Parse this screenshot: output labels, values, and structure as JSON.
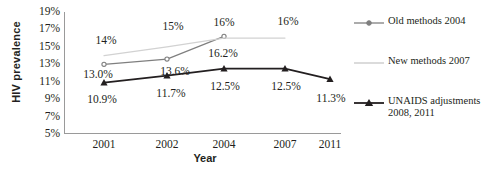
{
  "chart_data": {
    "type": "line",
    "title": "",
    "xlabel": "Year",
    "ylabel": "HIV prevalence",
    "categories": [
      "2001",
      "2002",
      "2004",
      "2007",
      "2011"
    ],
    "ylim": [
      5,
      19
    ],
    "ytick_labels": [
      "19%",
      "17%",
      "15%",
      "13%",
      "11%",
      "9%",
      "7%",
      "5%"
    ],
    "ytick_values": [
      19,
      17,
      15,
      13,
      11,
      9,
      7,
      5
    ],
    "grid": false,
    "legend_position": "right",
    "series": [
      {
        "name": "Old methods 2004",
        "color": "#7f7f7f",
        "marker": "circle",
        "x": [
          "2001",
          "2002",
          "2004"
        ],
        "values": [
          13.0,
          13.6,
          16.2
        ],
        "point_labels": [
          "13.0%",
          "13.6%",
          "16.2%"
        ]
      },
      {
        "name": "New methods 2007",
        "color": "#d2d2d2",
        "marker": "none",
        "x": [
          "2001",
          "2002",
          "2004",
          "2007"
        ],
        "values": [
          14.0,
          15.0,
          16.0,
          16.0
        ],
        "point_labels": [
          "14%",
          "15%",
          "16%",
          "16%"
        ]
      },
      {
        "name": "UNAIDS adjustments 2008, 2011",
        "color": "#231f20",
        "marker": "triangle",
        "x": [
          "2001",
          "2002",
          "2004",
          "2007",
          "2011"
        ],
        "values": [
          10.9,
          11.7,
          12.5,
          12.5,
          11.3
        ],
        "point_labels": [
          "10.9%",
          "11.7%",
          "12.5%",
          "12.5%",
          "11.3%"
        ]
      }
    ],
    "annotations": [
      {
        "text": "14%",
        "series": "New methods 2007",
        "category": "2001"
      },
      {
        "text": "15%",
        "series": "New methods 2007",
        "category": "2002"
      },
      {
        "text": "16%",
        "series": "New methods 2007",
        "category": "2004"
      },
      {
        "text": "16%",
        "series": "New methods 2007",
        "category": "2007"
      },
      {
        "text": "13.0%",
        "series": "Old methods 2004",
        "category": "2001"
      },
      {
        "text": "13.6%",
        "series": "Old methods 2004",
        "category": "2002"
      },
      {
        "text": "16.2%",
        "series": "Old methods 2004",
        "category": "2004"
      },
      {
        "text": "10.9%",
        "series": "UNAIDS adjustments",
        "category": "2001"
      },
      {
        "text": "11.7%",
        "series": "UNAIDS adjustments",
        "category": "2002"
      },
      {
        "text": "12.5%",
        "series": "UNAIDS adjustments",
        "category": "2004"
      },
      {
        "text": "12.5%",
        "series": "UNAIDS adjustments",
        "category": "2007"
      },
      {
        "text": "11.3%",
        "series": "UNAIDS adjustments",
        "category": "2011"
      }
    ]
  },
  "legend": {
    "items": [
      {
        "label": "Old methods 2004",
        "sub": "",
        "marker": "circle-marker-icon",
        "color": "#7f7f7f"
      },
      {
        "label": "New methods 2007",
        "sub": "",
        "marker": "line-swatch-icon",
        "color": "#d2d2d2"
      },
      {
        "label": "UNAIDS adjustments",
        "sub": "2008, 2011",
        "marker": "triangle-marker-icon",
        "color": "#231f20"
      }
    ]
  },
  "axes": {
    "y_title": "HIV prevalence",
    "x_title": "Year",
    "y_ticks": [
      "19%",
      "17%",
      "15%",
      "13%",
      "11%",
      "9%",
      "7%",
      "5%"
    ],
    "x_ticks": [
      "2001",
      "2002",
      "2004",
      "2007",
      "2011"
    ]
  }
}
